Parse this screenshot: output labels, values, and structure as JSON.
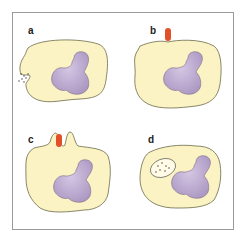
{
  "panels": [
    {
      "label": "a",
      "description": "Cell with particles adjacent to invaginating membrane"
    },
    {
      "label": "b",
      "description": "Cell with red object touching membrane"
    },
    {
      "label": "c",
      "description": "Membrane extensions surrounding red object"
    },
    {
      "label": "d",
      "description": "Internalized vesicle containing particles"
    }
  ],
  "colors": {
    "cytoplasm": "#fbf3c3",
    "cytoplasm_outline": "#6b6a4a",
    "nucleus": "#c3b2d6",
    "nucleus_outline": "#7a6a8a",
    "particle": "#e2502a",
    "frame": "#9a9a9a"
  }
}
